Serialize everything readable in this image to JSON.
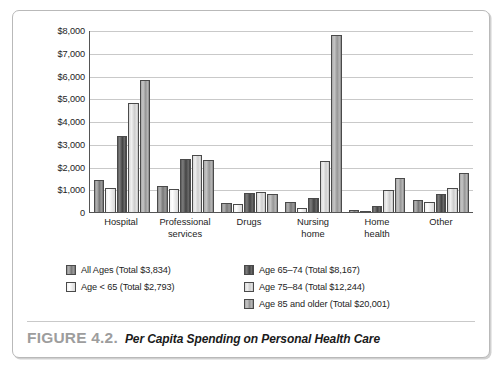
{
  "figure": {
    "caption_number": "FIGURE 4.2.",
    "caption_title": "Per Capita Spending on Personal Health Care"
  },
  "chart_data": {
    "type": "bar",
    "title": "Per Capita Spending on Personal Health Care",
    "xlabel": "",
    "ylabel": "",
    "ylim": [
      0,
      8000
    ],
    "grid": true,
    "legend_position": "bottom",
    "ytick_labels": [
      "$8,000",
      "$7,000",
      "$6,000",
      "$5,000",
      "$4,000",
      "$3,000",
      "$2,000",
      "$1,000",
      "0"
    ],
    "ytick_values": [
      8000,
      7000,
      6000,
      5000,
      4000,
      3000,
      2000,
      1000,
      0
    ],
    "categories": [
      "Hospital",
      "Professional services",
      "Drugs",
      "Nursing home",
      "Home health",
      "Other"
    ],
    "category_lines": [
      [
        "Hospital"
      ],
      [
        "Professional",
        "services"
      ],
      [
        "Drugs"
      ],
      [
        "Nursing",
        "home"
      ],
      [
        "Home",
        "health"
      ],
      [
        "Other"
      ]
    ],
    "series": [
      {
        "name": "All Ages (Total $3,834)",
        "color": "#8f8f8f",
        "values": [
          1420,
          1150,
          410,
          440,
          110,
          530
        ]
      },
      {
        "name": "Age < 65 (Total $2,793)",
        "color": "#f2f2f2",
        "values": [
          1040,
          990,
          350,
          160,
          60,
          440
        ]
      },
      {
        "name": "Age 65–74 (Total $8,167)",
        "color": "#4e4e4e",
        "values": [
          3320,
          2340,
          840,
          620,
          250,
          790
        ]
      },
      {
        "name": "Age 75–84 (Total $12,244)",
        "color": "#d8d8d8",
        "values": [
          4790,
          2500,
          900,
          2250,
          950,
          1050
        ]
      },
      {
        "name": "Age 85 and older (Total $20,001)",
        "color": "#a8a8a8",
        "values": [
          5800,
          2290,
          790,
          7800,
          1480,
          1720
        ]
      }
    ],
    "legend": [
      {
        "label": "All Ages (Total $3,834)",
        "series_index": 0,
        "column": "left"
      },
      {
        "label": "Age < 65 (Total $2,793)",
        "series_index": 1,
        "column": "left"
      },
      {
        "label": "Age 65–74 (Total $8,167)",
        "series_index": 2,
        "column": "right"
      },
      {
        "label": "Age 75–84 (Total $12,244)",
        "series_index": 3,
        "column": "right"
      },
      {
        "label": "Age 85 and older (Total $20,001)",
        "series_index": 4,
        "column": "right"
      }
    ]
  }
}
